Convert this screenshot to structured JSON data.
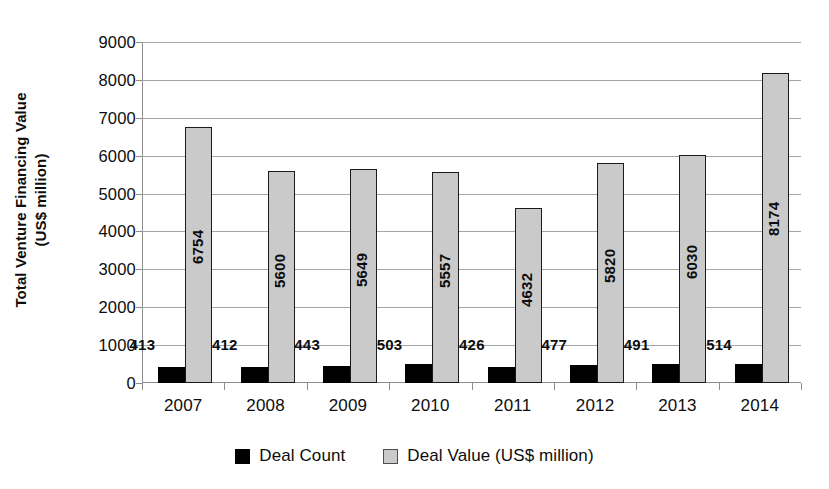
{
  "chart_data": {
    "type": "bar",
    "title": "",
    "xlabel": "",
    "ylabel": "Total Venture Financing Value (US$ million)",
    "ylabel_line1": "Total Venture Financing Value",
    "ylabel_line2": "(US$ million)",
    "categories": [
      "2007",
      "2008",
      "2009",
      "2010",
      "2011",
      "2012",
      "2013",
      "2014"
    ],
    "ylim": [
      0,
      9000
    ],
    "ytick_step": 1000,
    "yticks": [
      "9000",
      "8000",
      "7000",
      "6000",
      "5000",
      "4000",
      "3000",
      "2000",
      "1000",
      "0"
    ],
    "grid": true,
    "legend_position": "bottom",
    "series": [
      {
        "name": "Deal Count",
        "color": "#000000",
        "values": [
          413,
          412,
          443,
          503,
          426,
          477,
          491,
          514
        ],
        "labels": [
          "413",
          "412",
          "443",
          "503",
          "426",
          "477",
          "491",
          "514"
        ]
      },
      {
        "name": "Deal Value (US$ million)",
        "color": "#cacaca",
        "values": [
          6754,
          5600,
          5649,
          5557,
          4632,
          5820,
          6030,
          8174
        ],
        "labels": [
          "6754",
          "5600",
          "5649",
          "5557",
          "4632",
          "5820",
          "6030",
          "8174"
        ]
      }
    ]
  },
  "legend": {
    "items": [
      {
        "label": "Deal Count",
        "marker": "filled-square-black"
      },
      {
        "label": "Deal Value (US$ million)",
        "marker": "outlined-square-gray"
      }
    ]
  },
  "colors": {
    "background": "#ffffff",
    "gridline": "#a6a6a6",
    "axis": "#8c8c8c",
    "deal_count_bar": "#000000",
    "deal_value_bar": "#cacaca",
    "deal_value_border": "#1a1a1a",
    "text": "#0d0d0d"
  }
}
